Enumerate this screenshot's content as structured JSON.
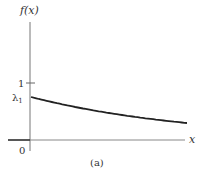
{
  "chart_data": {
    "type": "line",
    "title": "",
    "subtitle": "(a)",
    "xlabel": "x",
    "ylabel": "f(x)",
    "function": "f(x) = λ1·e^(−λ1·x)",
    "y_ticks": [
      {
        "label": "1",
        "value": 1
      },
      {
        "label": "λ1",
        "value": 0.8
      }
    ],
    "x_ticks": [
      {
        "label": "0",
        "value": 0
      }
    ],
    "series": [
      {
        "name": "f(x)",
        "x": [
          0,
          1,
          2,
          3,
          4,
          5,
          6
        ],
        "values": [
          0.8,
          0.68,
          0.58,
          0.5,
          0.43,
          0.37,
          0.32
        ]
      }
    ],
    "xlim": [
      0,
      6
    ],
    "ylim": [
      0,
      2.2
    ],
    "grid": false,
    "legend": "none"
  },
  "labels": {
    "y_axis": "f(x)",
    "x_axis": "x",
    "tick_one": "1",
    "tick_lambda": "λ",
    "tick_lambda_sub": "1",
    "origin": "0",
    "caption": "(a)"
  }
}
